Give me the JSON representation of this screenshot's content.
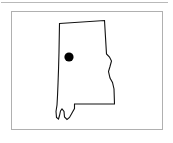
{
  "figure": {
    "caption": "",
    "background_color": "#ffffff",
    "rule": {
      "name": "top-horizontal-rule",
      "color": "#b9b9b9",
      "thickness_px": 1
    },
    "frame": {
      "name": "figure-frame",
      "border_color": "#b0b0b0",
      "border_width_px": 1,
      "fill_color": "#ffffff"
    }
  },
  "map": {
    "type": "state-outline-map",
    "region_name": "Alabama",
    "outline_color": "#111111",
    "outline_width_px": 1.1,
    "fill_color": "#ffffff",
    "outline_path": "M 47.5 11.5 L 92.5 8.5 L 94.5 42.0 L 97.5 45.0 L 99.5 49.0 L 98.0 54.5 L 96.5 59.5 L 98.0 66.0 L 100.5 70.5 L 102.0 77.0 L 102.5 92.0 L 62.5 92.0 L 62.5 96.5 L 60.0 101.0 L 57.5 105.5 L 55.0 107.5 L 52.5 105.0 L 52.0 99.5 L 50.0 97.0 L 48.5 99.0 L 47.5 103.5 L 46.5 107.0 L 44.5 105.5 L 44.0 99.5 L 45.0 93.0 L 45.5 84.0 L 46.0 72.0 L 46.5 58.0 L 47.0 40.0 Z",
    "bay_notch_path": "M 52.0 99.5 L 52.5 105.0 L 55.0 107.5 L 57.5 105.5 L 60.0 101.0 L 62.5 96.5",
    "markers": [
      {
        "name": "city-marker",
        "label": "",
        "shape": "filled-circle",
        "color": "#000000",
        "x": 57,
        "y": 45,
        "radius": 4.6
      }
    ]
  }
}
